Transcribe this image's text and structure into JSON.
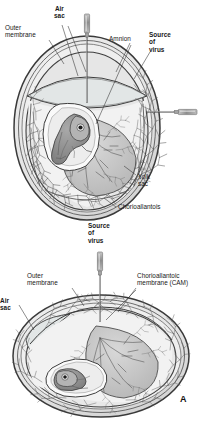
{
  "figure": {
    "panel_label": "A",
    "style": {
      "background": "#ffffff",
      "ink": "#2b2b2b",
      "shell_fill": "#e9e9e9",
      "albumen_fill": "#f3f3f3",
      "yolk_fill": "#c9c9c9",
      "embryo_fill": "#8f8f8f",
      "amnion_fill": "#fbfbfb",
      "vessel": "#5a5a5a",
      "needle": "#9a9a9a"
    },
    "top_diagram": {
      "name": "amniotic-inoculation-egg",
      "orientation": "vertical-egg",
      "labels": [
        {
          "id": "outer-membrane",
          "text": "Outer\nmembrane",
          "bold": false,
          "x": 5,
          "y": 24
        },
        {
          "id": "air-sac",
          "text": "Air\nsac",
          "bold": true,
          "x": 54,
          "y": 5
        },
        {
          "id": "amnion",
          "text": "Amnion",
          "bold": false,
          "x": 109,
          "y": 35
        },
        {
          "id": "source-of-virus",
          "text": "Source\nof\nvirus",
          "bold": true,
          "x": 149,
          "y": 31
        },
        {
          "id": "yolk-sac",
          "text": "Yolk\nsac",
          "bold": false,
          "x": 138,
          "y": 173
        },
        {
          "id": "chorioallantois",
          "text": "Chorioallantois",
          "bold": false,
          "x": 118,
          "y": 203
        }
      ],
      "needles": [
        {
          "id": "needle-air-sac",
          "orientation": "vertical-top"
        },
        {
          "id": "needle-amnion",
          "orientation": "horizontal-right"
        }
      ]
    },
    "bottom_diagram": {
      "name": "cam-inoculation-egg",
      "orientation": "horizontal-egg",
      "labels": [
        {
          "id": "source-of-virus",
          "text": "Source\nof\nvirus",
          "bold": true,
          "x": 88,
          "y": 222
        },
        {
          "id": "outer-membrane",
          "text": "Outer\nmembrane",
          "bold": false,
          "x": 27,
          "y": 272
        },
        {
          "id": "chorioallantoic-membrane",
          "text": "Chorioallantoic\nmembrane (CAM)",
          "bold": false,
          "x": 137,
          "y": 272
        },
        {
          "id": "air-sac",
          "text": "Air\nsac",
          "bold": true,
          "x": 0,
          "y": 297
        }
      ],
      "needles": [
        {
          "id": "needle-cam",
          "orientation": "vertical-top"
        }
      ]
    }
  }
}
